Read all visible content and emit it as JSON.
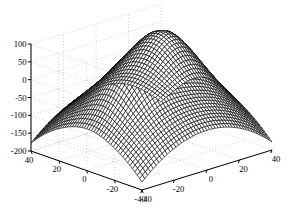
{
  "figure": {
    "type": "matlab-3d-mesh-figure",
    "width": 289,
    "height": 221,
    "background_color": "#ffffff",
    "mesh_color": "#000000",
    "axis_color": "#000000",
    "grid_color": "#999999",
    "grid_style": "dotted",
    "title": "",
    "projection": "perspective-3d"
  },
  "axes": {
    "x": {
      "label": "",
      "ticks": [
        "-40",
        "-20",
        "0",
        "20",
        "40"
      ],
      "values": [
        -40,
        -20,
        0,
        20,
        40
      ],
      "range": [
        -40,
        40
      ],
      "position": "bottom-right"
    },
    "y": {
      "label": "",
      "ticks": [
        "40",
        "20",
        "0",
        "-20",
        "-40"
      ],
      "values": [
        40,
        20,
        0,
        -20,
        -40
      ],
      "range": [
        -40,
        40
      ],
      "position": "bottom-left"
    },
    "z": {
      "label": "",
      "ticks": [
        "100",
        "50",
        "0",
        "-50",
        "-100",
        "-150",
        "-200"
      ],
      "values": [
        100,
        50,
        0,
        -50,
        -100,
        -150,
        -200
      ],
      "range": [
        -200,
        100
      ],
      "position": "left"
    }
  },
  "chart_data": {
    "type": "surface",
    "title": "",
    "xlabel": "",
    "ylabel": "",
    "zlabel": "",
    "xlim": [
      -40,
      40
    ],
    "ylim": [
      -40,
      40
    ],
    "zlim": [
      -200,
      100
    ],
    "grid": true,
    "legend": null,
    "style": "mesh-wireframe-dense",
    "view_azimuth": -37.5,
    "view_elevation": 30,
    "surface_description": "Saddle-shaped surface with one rounded local maximum ridge at left and a broad high lobe at right, falling steeply to about -200 at the front corners",
    "x_ticks": [
      -40,
      -20,
      0,
      20,
      40
    ],
    "y_ticks": [
      40,
      20,
      0,
      -20,
      -40
    ],
    "z_ticks": [
      -200,
      -150,
      -100,
      -50,
      0,
      50,
      100
    ],
    "function": "z = -(x^2 + y^2)/18 + 80*exp(-((x+14)^2+(y+2)^2)/260) + 120*exp(-((x-16)^2+(y-10)^2)/420)",
    "grid_n": 46,
    "z_min_observed": -200,
    "z_max_observed": 95
  }
}
